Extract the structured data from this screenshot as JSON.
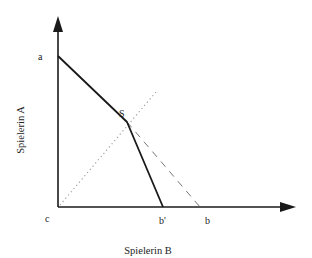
{
  "diagram": {
    "x_axis_label": "Spielerin B",
    "y_axis_label": "Spielerin A",
    "points": {
      "a": {
        "label": "a"
      },
      "b": {
        "label": "b"
      },
      "b_prime": {
        "label": "b'"
      },
      "c": {
        "label": "c"
      },
      "S": {
        "label": "S"
      }
    },
    "lines": [
      {
        "name": "frontier-a-S",
        "style": "solid",
        "from": "a",
        "to": "S"
      },
      {
        "name": "frontier-S-b-prime",
        "style": "solid",
        "from": "S",
        "to": "b'"
      },
      {
        "name": "original-frontier-S-b",
        "style": "dashed",
        "from": "S",
        "to": "b"
      },
      {
        "name": "diagonal-c-S",
        "style": "dotted",
        "from": "c",
        "to": "beyond S"
      }
    ],
    "colors": {
      "line": "#1a1a1a",
      "dashed": "#777777",
      "dotted": "#aaaaaa"
    }
  }
}
